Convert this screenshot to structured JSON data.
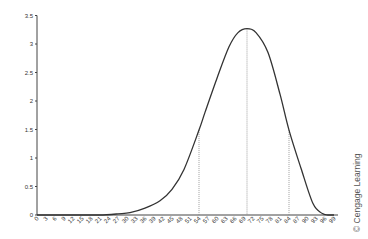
{
  "chart_data": {
    "type": "line",
    "title": "",
    "xlabel": "",
    "ylabel": "",
    "xlim": [
      0,
      99
    ],
    "ylim": [
      0,
      3.5
    ],
    "grid": false,
    "legend": null,
    "x_ticks": [
      0,
      3,
      6,
      9,
      12,
      15,
      18,
      21,
      24,
      27,
      30,
      33,
      36,
      39,
      42,
      45,
      48,
      51,
      54,
      57,
      60,
      63,
      66,
      69,
      72,
      75,
      78,
      81,
      84,
      87,
      90,
      93,
      96,
      99
    ],
    "y_ticks": [
      0,
      0.5,
      1,
      1.5,
      2,
      2.5,
      3,
      3.5
    ],
    "series": [
      {
        "name": "density curve",
        "x": [
          0,
          15,
          21,
          27,
          31,
          36,
          41,
          45,
          49,
          54,
          56,
          60,
          64,
          67,
          70,
          73,
          77,
          81,
          84,
          88,
          92,
          95,
          97,
          99
        ],
        "y": [
          0,
          0,
          0,
          0.02,
          0.04,
          0.12,
          0.25,
          0.45,
          0.8,
          1.49,
          1.8,
          2.4,
          2.95,
          3.2,
          3.27,
          3.2,
          2.85,
          2.12,
          1.49,
          0.82,
          0.2,
          0.03,
          0,
          0
        ]
      }
    ],
    "reference_lines": [
      {
        "x": 54,
        "y_top": 1.49,
        "style": "dotted"
      },
      {
        "x": 70,
        "y_top": 3.27,
        "style": "dotted"
      },
      {
        "x": 84,
        "y_top": 1.49,
        "style": "dotted"
      }
    ],
    "annotations": [
      "© Cengage Learning"
    ]
  },
  "credit": "© Cengage Learning"
}
